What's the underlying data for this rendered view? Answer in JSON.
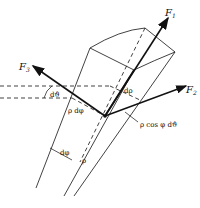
{
  "figure": {
    "forces": {
      "f1": "F",
      "f1_sub": "1",
      "f2": "F",
      "f2_sub": "2",
      "f3": "F",
      "f3_sub": "3"
    },
    "labels": {
      "d_theta": "dϑ",
      "d_rho": "dρ",
      "rho_d_phi": "ρ dφ",
      "rho_cos_phi_d_theta": "ρ cos φ dϑ",
      "d_phi": "dφ",
      "rho": "ρ"
    }
  }
}
